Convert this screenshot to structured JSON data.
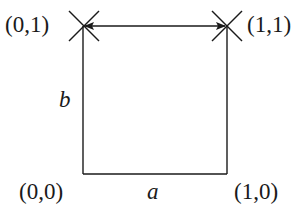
{
  "diagram": {
    "type": "unit-square-mapping",
    "corners": [
      {
        "id": "top-left",
        "label": "(0,1)",
        "x": 83,
        "y": 26,
        "marker": "x-cross"
      },
      {
        "id": "top-right",
        "label": "(1,1)",
        "x": 227,
        "y": 26,
        "marker": "x-cross"
      },
      {
        "id": "bottom-left",
        "label": "(0,0)",
        "x": 83,
        "y": 174
      },
      {
        "id": "bottom-right",
        "label": "(1,0)",
        "x": 227,
        "y": 174
      }
    ],
    "edges": {
      "left": {
        "label": "b"
      },
      "bottom": {
        "label": "a"
      },
      "top": {
        "style": "double-headed-arrow"
      },
      "right": {
        "style": "line"
      }
    },
    "colors": {
      "stroke": "#1a1a1a",
      "background": "#ffffff"
    }
  }
}
